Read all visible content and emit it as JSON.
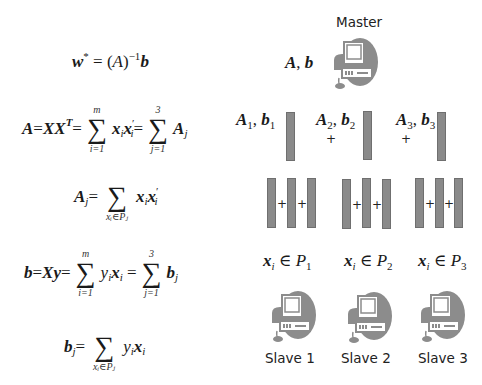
{
  "formulas": {
    "w_star": {
      "lhs": "w",
      "lhs_sup": "*",
      "eq": " = (",
      "A": "A",
      "close": ")",
      "inv": "−1",
      "b": "b"
    },
    "A_def": {
      "A": "A",
      "eq1": " = ",
      "XX": "XX",
      "T": "T",
      "eq2": " = ",
      "sum1_top": "m",
      "sum1_bot": "i=1",
      "x1": "x",
      "x1_sub": "i",
      "x2": "x",
      "x2_prime": "′",
      "x2_sub": "i",
      "eq3": " = ",
      "sum2_top": "3",
      "sum2_bot": "j=1",
      "Aj": "A",
      "Aj_sub": "j"
    },
    "Aj_def": {
      "A": "A",
      "A_sub": "j",
      "eq": " = ",
      "sum_bot": "xᵢ∈Pⱼ",
      "x1": "x",
      "x1_sub": "i",
      "x2": "x",
      "x2_prime": "′",
      "x2_sub": "i"
    },
    "b_def": {
      "b": "b",
      "eq1": " = ",
      "Xy": "Xy",
      "eq2": " = ",
      "sum1_top": "m",
      "sum1_bot": "i=1",
      "y": "y",
      "y_sub": "i",
      "x": "x",
      "x_sub": "i",
      "eq3": " = ",
      "sum2_top": "3",
      "sum2_bot": "j=1",
      "bj": "b",
      "bj_sub": "j"
    },
    "bj_def": {
      "b": "b",
      "b_sub": "j",
      "eq": " = ",
      "sum_bot": "xᵢ∈Pⱼ",
      "y": "y",
      "y_sub": "i",
      "x": "x",
      "x_sub": "i"
    }
  },
  "master": {
    "label": "Master",
    "payload": {
      "A": "A",
      "sep": ", ",
      "b": "b"
    }
  },
  "partials": [
    {
      "A": "A",
      "sub": "1",
      "sep": ", ",
      "b": "b"
    },
    {
      "A": "A",
      "sub": "2",
      "sep": ", ",
      "b": "b"
    },
    {
      "A": "A",
      "sub": "3",
      "sep": ", ",
      "b": "b"
    }
  ],
  "operators": {
    "plus": "+"
  },
  "partitions": [
    {
      "x": "x",
      "x_sub": "i",
      "in": " ∈ ",
      "P": "P",
      "P_sub": "1"
    },
    {
      "x": "x",
      "x_sub": "i",
      "in": " ∈ ",
      "P": "P",
      "P_sub": "2"
    },
    {
      "x": "x",
      "x_sub": "i",
      "in": " ∈ ",
      "P": "P",
      "P_sub": "3"
    }
  ],
  "slaves": [
    {
      "label": "Slave 1"
    },
    {
      "label": "Slave 2"
    },
    {
      "label": "Slave 3"
    }
  ],
  "colors": {
    "bar_fill": "#8a8a8a",
    "bar_border": "#6f6f6f",
    "icon_gray": "#8c8c8c",
    "background": "#ffffff"
  }
}
